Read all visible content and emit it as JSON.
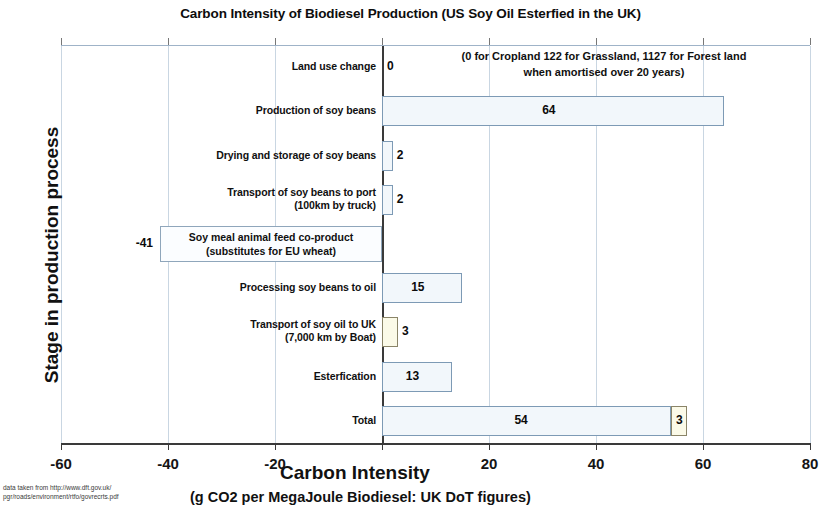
{
  "chart_data": {
    "type": "bar",
    "orientation": "horizontal",
    "title": "Carbon Intensity of Biodiesel Production (US Soy Oil Esterfied in the UK)",
    "xlabel": "Carbon Intensity",
    "xlabel_sub": "(g CO2 per MegaJoule Biodiesel: UK DoT figures)",
    "ylabel": "Stage in production process",
    "xlim": [
      -60,
      80
    ],
    "xticks": [
      -60,
      -40,
      -20,
      0,
      20,
      40,
      60,
      80
    ],
    "xtick_labels": [
      "-60",
      "-40",
      "-20",
      "",
      "20",
      "40",
      "60",
      "80"
    ],
    "grid": true,
    "legend": "none",
    "categories": [
      "Land use change",
      "Production of soy beans",
      "Drying and storage of soy beans",
      "Transport of soy beans to port\n(100km by truck)",
      "Soy meal animal feed co-product\n(substitutes for EU wheat)",
      "Processing soy beans to oil",
      "Transport of soy oil to UK\n(7,000 km by Boat)",
      "Esterfication",
      "Total"
    ],
    "values": [
      0,
      64,
      2,
      2,
      -41,
      15,
      3,
      13,
      54
    ],
    "value_labels": [
      "0",
      "64",
      "2",
      "2",
      "-41",
      "15",
      "3",
      "13",
      "54"
    ],
    "series": [
      {
        "name": "Stage value",
        "values": [
          0,
          64,
          2,
          2,
          -41,
          15,
          3,
          13,
          54
        ]
      },
      {
        "name": "Total extra segment",
        "values": [
          null,
          null,
          null,
          null,
          null,
          null,
          null,
          null,
          3
        ]
      }
    ],
    "total_extra_segment": {
      "category": "Total",
      "start": 54,
      "value": 3,
      "label": "3"
    },
    "cream_segment_categories": [
      "Transport of soy oil to UK\n(7,000 km by Boat)",
      "Total extra"
    ],
    "annotation": "(0 for Cropland 122 for Grassland, 1127 for Forest land\nwhen amortised over 20 years)",
    "source_note": "data taken from http://www.dft.gov.uk/\npgr/roads/environment/rtfo/govrecrts.pdf",
    "colors": {
      "bar_fill": "#f2f7fb",
      "bar_border": "#7d9ab5",
      "cream_fill": "#fbfae8",
      "cream_border": "#8a8468",
      "gridline": "#c9d6e2",
      "axis": "#3a3a3a",
      "text": "#101010"
    }
  }
}
